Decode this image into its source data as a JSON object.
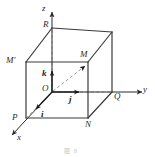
{
  "figure": {
    "caption": "图 8",
    "colors": {
      "solid_edge": "#3a3a3a",
      "hidden_edge": "#b0b0b0",
      "axis": "#3a3a3a",
      "vector": "#1a1a1a",
      "background": "#ffffff",
      "label_text": "#2b2b2b"
    },
    "axes": [
      {
        "name": "z",
        "label": "z",
        "direction": "up"
      },
      {
        "name": "y",
        "label": "y",
        "direction": "right"
      },
      {
        "name": "x",
        "label": "x",
        "direction": "lower-left"
      }
    ],
    "unit_vectors": [
      {
        "name": "k",
        "label": "k",
        "direction": "up",
        "along_axis": "z"
      },
      {
        "name": "j",
        "label": "j",
        "direction": "right",
        "along_axis": "y"
      },
      {
        "name": "i",
        "label": "i",
        "direction": "lower-left",
        "along_axis": "x"
      }
    ],
    "vertices": [
      {
        "name": "R",
        "label": "R",
        "position": "top-back-left"
      },
      {
        "name": "M_prime",
        "label": "M'",
        "position": "top-front-left"
      },
      {
        "name": "M",
        "label": "M",
        "position": "top-front-right"
      },
      {
        "name": "O",
        "label": "O",
        "position": "origin-back-bottom-left"
      },
      {
        "name": "P",
        "label": "P",
        "position": "bottom-front-left"
      },
      {
        "name": "N",
        "label": "N",
        "position": "bottom-front-right"
      },
      {
        "name": "Q",
        "label": "Q",
        "position": "bottom-back-right"
      }
    ],
    "position_vector": {
      "name": "OM",
      "from": "O",
      "to": "M",
      "style": "dashed-with-arrowhead"
    }
  }
}
